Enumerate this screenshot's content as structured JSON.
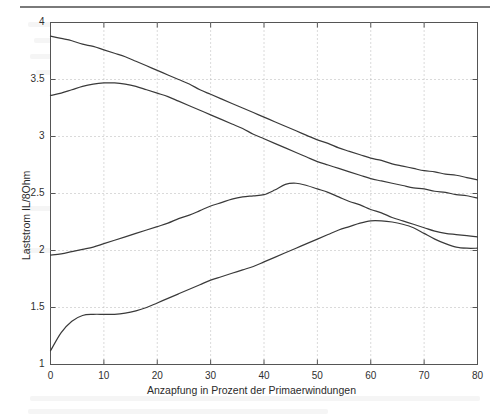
{
  "figure": {
    "top_rule": "horizontal-rule",
    "background_color": "#ffffff",
    "line_color": "#3a3a3a",
    "grid_color": "#b5b5b5",
    "axis_color": "#555555"
  },
  "chart_data": {
    "type": "line",
    "title": "",
    "xlabel": "Anzapfung in Prozent der Primaerwindungen",
    "ylabel": "Laststrom IL/8Ohm",
    "xlim": [
      0,
      80
    ],
    "ylim": [
      1,
      4
    ],
    "xticks": [
      0,
      10,
      20,
      30,
      40,
      50,
      60,
      70,
      80
    ],
    "xtick_labels": [
      "0",
      "10",
      "20",
      "30",
      "40",
      "50",
      "60",
      "70",
      "80"
    ],
    "yticks": [
      1,
      1.5,
      2,
      2.5,
      3,
      3.5,
      4
    ],
    "ytick_labels": [
      "1",
      "1.5",
      "2",
      "2.5",
      "3",
      "3.5",
      "4"
    ],
    "grid": true,
    "grid_style": "dotted",
    "legend": null,
    "legend_position": "none",
    "x": [
      0,
      2,
      4,
      6,
      8,
      10,
      12,
      14,
      16,
      18,
      20,
      22,
      24,
      26,
      28,
      30,
      32,
      34,
      36,
      38,
      40,
      42,
      44,
      46,
      48,
      50,
      52,
      54,
      56,
      58,
      60,
      62,
      64,
      66,
      68,
      70,
      72,
      74,
      76,
      78,
      80
    ],
    "series": [
      {
        "name": "curve-1",
        "values": [
          3.88,
          3.86,
          3.84,
          3.81,
          3.79,
          3.76,
          3.73,
          3.7,
          3.66,
          3.62,
          3.58,
          3.54,
          3.5,
          3.46,
          3.41,
          3.37,
          3.33,
          3.29,
          3.25,
          3.21,
          3.17,
          3.13,
          3.09,
          3.05,
          3.01,
          2.97,
          2.94,
          2.9,
          2.87,
          2.84,
          2.81,
          2.79,
          2.76,
          2.74,
          2.72,
          2.7,
          2.69,
          2.67,
          2.66,
          2.64,
          2.62
        ]
      },
      {
        "name": "curve-2",
        "values": [
          3.36,
          3.38,
          3.41,
          3.44,
          3.46,
          3.47,
          3.47,
          3.46,
          3.44,
          3.41,
          3.38,
          3.35,
          3.31,
          3.27,
          3.23,
          3.19,
          3.15,
          3.11,
          3.07,
          3.02,
          2.98,
          2.94,
          2.9,
          2.86,
          2.82,
          2.78,
          2.75,
          2.72,
          2.69,
          2.66,
          2.63,
          2.61,
          2.59,
          2.57,
          2.55,
          2.54,
          2.52,
          2.51,
          2.49,
          2.48,
          2.46
        ]
      },
      {
        "name": "curve-3",
        "values": [
          1.96,
          1.97,
          1.99,
          2.01,
          2.03,
          2.06,
          2.09,
          2.12,
          2.15,
          2.18,
          2.21,
          2.24,
          2.28,
          2.31,
          2.35,
          2.39,
          2.42,
          2.45,
          2.47,
          2.48,
          2.49,
          2.53,
          2.58,
          2.59,
          2.57,
          2.54,
          2.51,
          2.47,
          2.43,
          2.4,
          2.36,
          2.33,
          2.29,
          2.26,
          2.23,
          2.2,
          2.17,
          2.15,
          2.14,
          2.13,
          2.12
        ]
      },
      {
        "name": "curve-4",
        "values": [
          1.12,
          1.28,
          1.38,
          1.43,
          1.44,
          1.44,
          1.44,
          1.45,
          1.47,
          1.5,
          1.54,
          1.58,
          1.62,
          1.66,
          1.7,
          1.74,
          1.77,
          1.8,
          1.83,
          1.86,
          1.9,
          1.94,
          1.98,
          2.02,
          2.06,
          2.1,
          2.14,
          2.18,
          2.21,
          2.24,
          2.26,
          2.26,
          2.25,
          2.23,
          2.2,
          2.15,
          2.1,
          2.06,
          2.03,
          2.02,
          2.02
        ]
      }
    ]
  }
}
